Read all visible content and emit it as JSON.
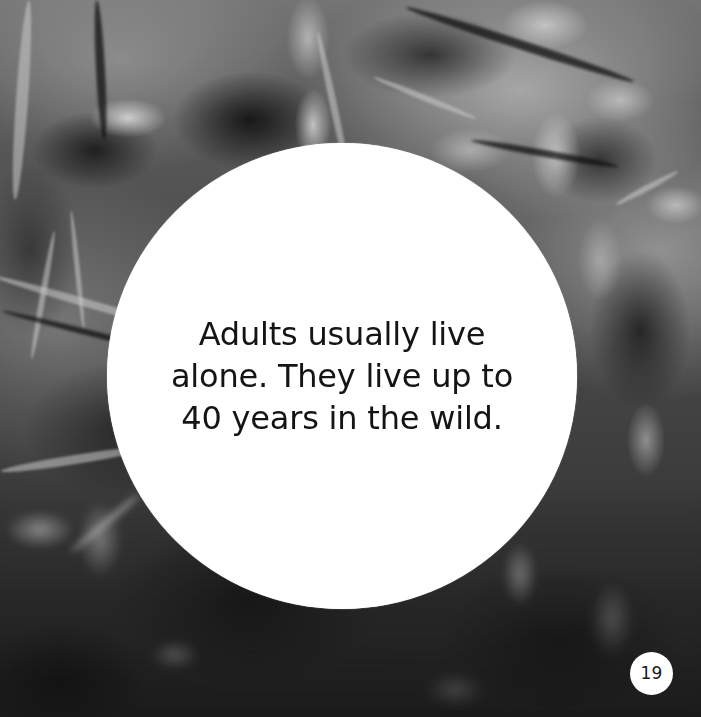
{
  "page": {
    "width": 701,
    "height": 717,
    "background_description": "grayscale photograph of blurred forest foliage, leaves and thin branches",
    "page_number": "19"
  },
  "caption": {
    "text": "Adults usually live\nalone. They live up to\n40 years in the wild.",
    "lines": [
      "Adults usually live",
      "alone. They live up to",
      "40 years in the wild."
    ]
  },
  "colors": {
    "caption_background": "#ffffff",
    "caption_text": "#141414",
    "badge_background": "#ffffff",
    "badge_text": "#1a1a1a",
    "photo_base": "#4f4f4c"
  }
}
